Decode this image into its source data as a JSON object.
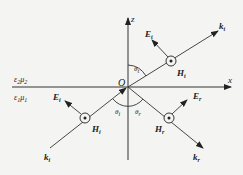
{
  "axes": {
    "z_label": "z",
    "x_label": "x",
    "origin_label": "O"
  },
  "media": {
    "upper": {
      "eps": "ε",
      "eps_sub": "2",
      "mu": "μ",
      "mu_sub": "2"
    },
    "lower": {
      "eps": "ε",
      "eps_sub": "1",
      "mu": "μ",
      "mu_sub": "1"
    }
  },
  "waves": {
    "transmitted": {
      "E": "E",
      "H": "H",
      "k": "k",
      "sub": "t",
      "angle": "θ",
      "angle_sub": "t"
    },
    "incident": {
      "E": "E",
      "H": "H",
      "k": "k",
      "sub": "i",
      "angle": "θ",
      "angle_sub": "i"
    },
    "reflected": {
      "E": "E",
      "H": "H",
      "k": "k",
      "sub": "r",
      "angle": "θ",
      "angle_sub": "r"
    }
  },
  "icons": {
    "H_field_symbol": "out-of-page dot-in-circle"
  },
  "colors": {
    "background": "#f4f4f2",
    "ink": "#333333"
  }
}
